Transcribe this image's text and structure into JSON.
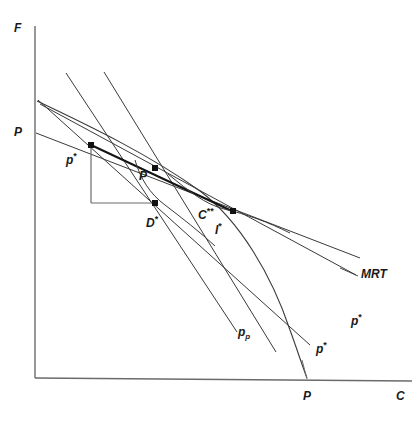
{
  "figure": {
    "type": "economics-diagram"
  },
  "axes": {
    "y_axis_label": "F",
    "x_axis_label": "C",
    "y_axis_tick_label": "P",
    "x_axis_tick_label": "P"
  },
  "points": [
    {
      "id": "p-star-point",
      "label": "p",
      "sup": "*",
      "x": 91,
      "y": 145
    },
    {
      "id": "p-point",
      "label": "P",
      "sup": "",
      "x": 155,
      "y": 168
    },
    {
      "id": "d-star-point",
      "label": "D",
      "sup": "*",
      "x": 155,
      "y": 203
    },
    {
      "id": "c-double-star-point",
      "label": "C",
      "sup": "**",
      "x": 222,
      "y": 207
    }
  ],
  "labels": {
    "y_axis": "F",
    "x_axis": "C",
    "p_on_y_axis": "P",
    "p_on_x_axis": "P",
    "p_star_upper": "p",
    "p_star_upper_sup": "*",
    "p_production": "P",
    "d_star": "D",
    "d_star_sup": "*",
    "c_double_star": "C",
    "c_double_star_sup": "**",
    "i_star": "I",
    "i_star_sup": "*",
    "mrt": "MRT",
    "p_p_line": "p",
    "p_p_line_sub": "p",
    "p_star_line_1": "p",
    "p_star_line_1_sup": "*",
    "p_star_line_2": "p",
    "p_star_line_2_sup": "*"
  },
  "style": {
    "line_color": "#3a3a3a",
    "axis_color": "#6b6b6b",
    "point_color": "#111111",
    "background": "#ffffff"
  }
}
